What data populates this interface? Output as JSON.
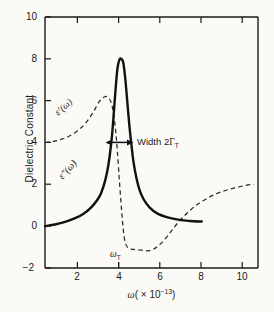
{
  "figure": {
    "name": "dielectric-constant-vs-frequency",
    "background_color": "#fbfaf7",
    "ink_color": "#1a1a1a"
  },
  "axis_titles": {
    "y": "Dielectric Constant",
    "x_omega": "ω",
    "x_factor_open": "( × 10",
    "x_exponent": "−13",
    "x_factor_close": ")"
  },
  "y_ticks": [
    "10",
    "8",
    "6",
    "4",
    "2",
    "0",
    "−2"
  ],
  "x_ticks": [
    "2",
    "4",
    "6",
    "8",
    "10"
  ],
  "labels": {
    "eps_real": "ε′(ω)",
    "eps_imag": "ε″(ω)",
    "omega_t": "ω",
    "omega_t_sub": "T",
    "width_text": "Width 2",
    "width_gamma": "Γ",
    "width_gamma_sub": "T"
  },
  "chart_data": {
    "type": "line",
    "title": "",
    "xlabel": "ω ( × 10⁻¹³ )",
    "ylabel": "Dielectric Constant",
    "xlim": [
      0.2,
      10.8
    ],
    "ylim": [
      -2,
      10
    ],
    "xticks": [
      2,
      4,
      6,
      8,
      10
    ],
    "yticks": [
      -2,
      0,
      2,
      4,
      6,
      8,
      10
    ],
    "grid": false,
    "legend": "inline-curve-labels",
    "annotations": [
      {
        "name": "omega-T-marker",
        "text": "ω_T",
        "x": 4.0,
        "y": -2.0,
        "note": "resonance frequency label below x-axis at ω = 4"
      },
      {
        "name": "width-arrow",
        "text": "Width 2Γ_T",
        "x_start": 3.55,
        "x_end": 4.7,
        "y": 4.0,
        "note": "double-headed horizontal arrow across FWHM of ε″ peak at y = 4"
      }
    ],
    "series": [
      {
        "name": "ε′(ω)",
        "style": "dashed",
        "color": "#1a1a1a",
        "x": [
          0.2,
          0.6,
          1.0,
          1.4,
          1.8,
          2.2,
          2.6,
          2.9,
          3.2,
          3.4,
          3.55,
          3.7,
          3.8,
          3.9,
          4.0,
          4.1,
          4.2,
          4.35,
          4.5,
          4.7,
          5.0,
          5.3,
          5.6,
          6.0,
          6.4,
          6.8,
          7.3,
          7.8,
          8.4,
          9.0,
          9.6,
          10.2,
          10.6
        ],
        "y": [
          4.0,
          4.05,
          4.15,
          4.3,
          4.55,
          4.9,
          5.45,
          5.95,
          6.2,
          6.1,
          5.7,
          4.7,
          3.6,
          2.2,
          0.9,
          -0.2,
          -0.8,
          -1.05,
          -1.1,
          -1.12,
          -1.15,
          -1.18,
          -1.1,
          -0.8,
          -0.35,
          0.15,
          0.65,
          1.05,
          1.4,
          1.65,
          1.82,
          1.95,
          2.0
        ]
      },
      {
        "name": "ε″(ω)",
        "style": "solid",
        "color": "#111111",
        "x": [
          0.2,
          0.7,
          1.2,
          1.7,
          2.1,
          2.5,
          2.8,
          3.0,
          3.2,
          3.35,
          3.5,
          3.6,
          3.7,
          3.8,
          3.9,
          4.0,
          4.1,
          4.2,
          4.3,
          4.4,
          4.5,
          4.6,
          4.75,
          4.9,
          5.1,
          5.4,
          5.8,
          6.3,
          6.9,
          7.4,
          8.0
        ],
        "y": [
          0.0,
          0.08,
          0.2,
          0.38,
          0.58,
          0.9,
          1.25,
          1.6,
          2.2,
          2.9,
          4.0,
          5.1,
          6.4,
          7.5,
          7.95,
          8.0,
          7.8,
          7.0,
          5.9,
          4.8,
          3.9,
          3.1,
          2.3,
          1.75,
          1.3,
          0.9,
          0.6,
          0.42,
          0.3,
          0.25,
          0.22
        ]
      }
    ]
  }
}
